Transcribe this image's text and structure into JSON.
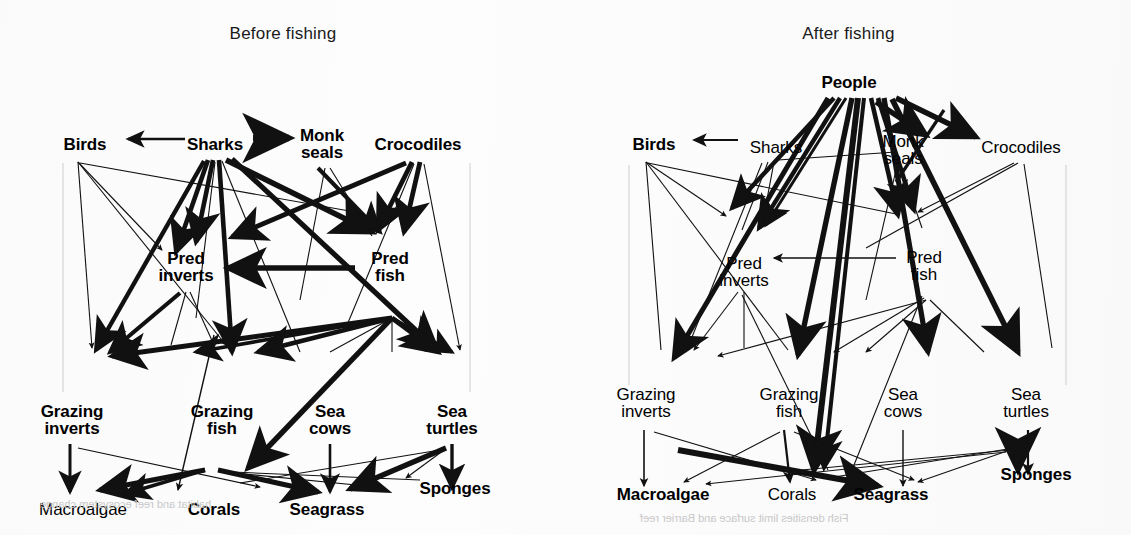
{
  "figure": {
    "type": "food-web-diagram",
    "background_color": "#fdfdfd",
    "line_color": "#111111"
  },
  "panels": [
    {
      "id": "before",
      "title": "Before fishing",
      "nodes": [
        {
          "id": "birds",
          "label": "Birds",
          "weight": "bold",
          "x": 85,
          "y": 145
        },
        {
          "id": "sharks",
          "label": "Sharks",
          "weight": "bold",
          "x": 215,
          "y": 145
        },
        {
          "id": "monkseals",
          "label": "Monk\nseals",
          "weight": "bold",
          "x": 322,
          "y": 144
        },
        {
          "id": "crocodiles",
          "label": "Crocodiles",
          "weight": "bold",
          "x": 418,
          "y": 145
        },
        {
          "id": "predinverts",
          "label": "Pred\ninverts",
          "weight": "bold",
          "x": 186,
          "y": 267
        },
        {
          "id": "predfish",
          "label": "Pred\nfish",
          "weight": "bold",
          "x": 390,
          "y": 267
        },
        {
          "id": "grazinverts",
          "label": "Grazing\ninverts",
          "weight": "bold",
          "x": 72,
          "y": 420
        },
        {
          "id": "grazfish",
          "label": "Grazing\nfish",
          "weight": "bold",
          "x": 222,
          "y": 420
        },
        {
          "id": "seacows",
          "label": "Sea\ncows",
          "weight": "bold",
          "x": 330,
          "y": 420
        },
        {
          "id": "seaturtles",
          "label": "Sea\nturtles",
          "weight": "bold",
          "x": 452,
          "y": 420
        },
        {
          "id": "macroalgae",
          "label": "Macroalgae",
          "weight": "regular",
          "x": 83,
          "y": 510
        },
        {
          "id": "corals",
          "label": "Corals",
          "weight": "bold",
          "x": 214,
          "y": 510
        },
        {
          "id": "seagrass",
          "label": "Seagrass",
          "weight": "bold",
          "x": 327,
          "y": 510
        },
        {
          "id": "sponges",
          "label": "Sponges",
          "weight": "bold",
          "x": 455,
          "y": 489
        }
      ]
    },
    {
      "id": "after",
      "title": "After fishing",
      "nodes": [
        {
          "id": "people",
          "label": "People",
          "weight": "bold",
          "x": 283,
          "y": 83
        },
        {
          "id": "birds",
          "label": "Birds",
          "weight": "bold",
          "x": 88,
          "y": 145
        },
        {
          "id": "sharks",
          "label": "Sharks",
          "weight": "regular",
          "x": 210,
          "y": 148
        },
        {
          "id": "monkseals",
          "label": "Monk\nseals",
          "weight": "regular",
          "x": 337,
          "y": 150
        },
        {
          "id": "crocodiles",
          "label": "Crocodiles",
          "weight": "regular",
          "x": 455,
          "y": 148
        },
        {
          "id": "predinverts",
          "label": "Pred\ninverts",
          "weight": "regular",
          "x": 178,
          "y": 272
        },
        {
          "id": "predfish",
          "label": "Pred\nfish",
          "weight": "regular",
          "x": 358,
          "y": 266
        },
        {
          "id": "grazinverts",
          "label": "Grazing\ninverts",
          "weight": "regular",
          "x": 80,
          "y": 403
        },
        {
          "id": "grazfish",
          "label": "Grazing\nfish",
          "weight": "regular",
          "x": 223,
          "y": 403
        },
        {
          "id": "seacows",
          "label": "Sea\ncows",
          "weight": "regular",
          "x": 337,
          "y": 403
        },
        {
          "id": "seaturtles",
          "label": "Sea\nturtles",
          "weight": "regular",
          "x": 460,
          "y": 403
        },
        {
          "id": "macroalgae",
          "label": "Macroalgae",
          "weight": "bold",
          "x": 97,
          "y": 495
        },
        {
          "id": "corals",
          "label": "Corals",
          "weight": "regular",
          "x": 226,
          "y": 495
        },
        {
          "id": "seagrass",
          "label": "Seagrass",
          "weight": "bold",
          "x": 325,
          "y": 495
        },
        {
          "id": "sponges",
          "label": "Sponges",
          "weight": "bold",
          "x": 470,
          "y": 475
        }
      ]
    }
  ],
  "legend_note": {
    "meaning": "Arrow thickness indicates strength of interaction; bold labels indicate abundant groups, thin labels indicate depleted groups."
  },
  "bleed_text": {
    "left": "habitat and reef ecosystem change",
    "right": "Fish densities limit surface and Barrier reef"
  }
}
